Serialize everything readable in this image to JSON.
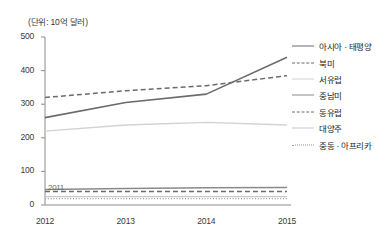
{
  "chart_data": {
    "type": "line",
    "title": "",
    "unit_note": "(단위: 10억 달러)",
    "xlabel": "",
    "ylabel": "",
    "x": [
      "2012",
      "2013",
      "2014",
      "2015"
    ],
    "categories": [
      "2012",
      "2013",
      "2014",
      "2015"
    ],
    "xtick_labels": [
      "2012",
      "2013",
      "2014",
      "2015"
    ],
    "ytick_labels": [
      "0",
      "100",
      "200",
      "300",
      "400",
      "500"
    ],
    "yticks": [
      0,
      100,
      200,
      300,
      400,
      500
    ],
    "ylim": [
      0,
      500
    ],
    "grid": false,
    "legend_position": "right",
    "annotations": [
      {
        "text": "2011",
        "x": "2012",
        "y": 40
      }
    ],
    "series": [
      {
        "name": "아시아 · 태평양",
        "values": [
          260,
          305,
          330,
          440
        ],
        "style": "solid",
        "color": "#6b6b6b",
        "width": 1.6
      },
      {
        "name": "북미",
        "values": [
          320,
          340,
          355,
          385
        ],
        "style": "dashed",
        "color": "#6b6b6b",
        "width": 1.5
      },
      {
        "name": "서유럽",
        "values": [
          220,
          238,
          246,
          238
        ],
        "style": "solid",
        "color": "#d2d2d2",
        "width": 1.4
      },
      {
        "name": "중남미",
        "values": [
          46,
          49,
          51,
          52
        ],
        "style": "solid",
        "color": "#8a8a8a",
        "width": 1.5
      },
      {
        "name": "동유럽",
        "values": [
          40,
          40,
          40,
          40
        ],
        "style": "dashed",
        "color": "#6b6b6b",
        "width": 1.4
      },
      {
        "name": "대양주",
        "values": [
          25,
          25,
          25,
          25
        ],
        "style": "solid",
        "color": "#c8c8c8",
        "width": 1.3
      },
      {
        "name": "중동 · 아프리카",
        "values": [
          19,
          19,
          19,
          19
        ],
        "style": "dotted",
        "color": "#9a9a9a",
        "width": 1.3
      }
    ]
  },
  "axes": {
    "y_labels": [
      "500",
      "400",
      "300",
      "200",
      "100",
      "0"
    ],
    "x_labels": [
      "2012",
      "2013",
      "2014",
      "2015"
    ]
  },
  "legend": {
    "items": [
      {
        "label": "아시아 · 태평양",
        "style": "solid",
        "color": "#6b6b6b"
      },
      {
        "label": "북미",
        "style": "dashed",
        "color": "#6b6b6b"
      },
      {
        "label": "서유럽",
        "style": "solid",
        "color": "#d2d2d2"
      },
      {
        "label": "중남미",
        "style": "solid",
        "color": "#8a8a8a"
      },
      {
        "label": "동유럽",
        "style": "dashed",
        "color": "#6b6b6b"
      },
      {
        "label": "대양주",
        "style": "solid",
        "color": "#c8c8c8"
      },
      {
        "label": "중동 · 아프리카",
        "style": "dotted",
        "color": "#9a9a9a"
      }
    ]
  },
  "colors": {
    "axis": "#8c8c8c",
    "text": "#231f20",
    "background": "#ffffff"
  }
}
